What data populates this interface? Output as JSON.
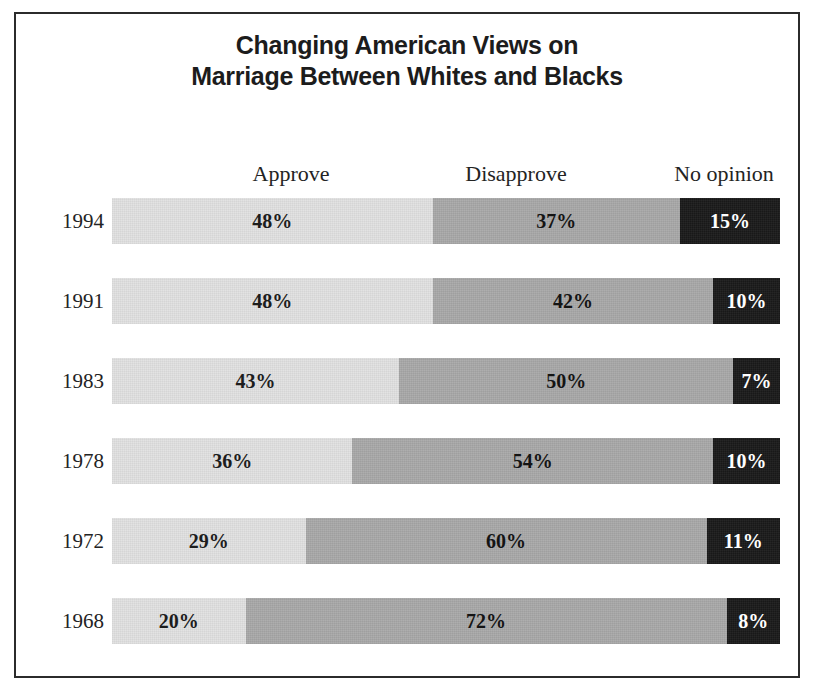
{
  "figure": {
    "title_lines": [
      "Changing American Views on",
      "Marriage Between Whites and Blacks"
    ],
    "border_color": "#2b2b2b",
    "background": "#ffffff"
  },
  "legend_headers": {
    "approve": "Approve",
    "disapprove": "Disapprove",
    "no_opinion": "No opinion"
  },
  "colors": {
    "approve": "#e2e2e2",
    "disapprove": "#a9a9a9",
    "no_opinion": "#1a1a1a",
    "text_dark": "#1d1d1d",
    "text_light": "#ffffff"
  },
  "rows": [
    {
      "year": "1994",
      "approve_label": "48%",
      "disapprove_label": "37%",
      "no_opinion_label": "15%",
      "approve": 48,
      "disapprove": 37,
      "no_opinion": 15
    },
    {
      "year": "1991",
      "approve_label": "48%",
      "disapprove_label": "42%",
      "no_opinion_label": "10%",
      "approve": 48,
      "disapprove": 42,
      "no_opinion": 10
    },
    {
      "year": "1983",
      "approve_label": "43%",
      "disapprove_label": "50%",
      "no_opinion_label": "7%",
      "approve": 43,
      "disapprove": 50,
      "no_opinion": 7
    },
    {
      "year": "1978",
      "approve_label": "36%",
      "disapprove_label": "54%",
      "no_opinion_label": "10%",
      "approve": 36,
      "disapprove": 54,
      "no_opinion": 10
    },
    {
      "year": "1972",
      "approve_label": "29%",
      "disapprove_label": "60%",
      "no_opinion_label": "11%",
      "approve": 29,
      "disapprove": 60,
      "no_opinion": 11
    },
    {
      "year": "1968",
      "approve_label": "20%",
      "disapprove_label": "72%",
      "no_opinion_label": "8%",
      "approve": 20,
      "disapprove": 72,
      "no_opinion": 8
    }
  ],
  "chart_data": {
    "type": "bar",
    "orientation": "horizontal",
    "stacked": true,
    "stack_total": 100,
    "title": "Changing American Views on Marriage Between Whites and Blacks",
    "subtitle": "",
    "xlabel": "",
    "ylabel": "",
    "xlim": [
      0,
      100
    ],
    "grid": false,
    "legend_position": "top",
    "value_format": "percent",
    "categories": [
      "1994",
      "1991",
      "1983",
      "1978",
      "1972",
      "1968"
    ],
    "series": [
      {
        "name": "Approve",
        "color": "#e2e2e2",
        "values": [
          48,
          48,
          43,
          36,
          29,
          20
        ]
      },
      {
        "name": "Disapprove",
        "color": "#a9a9a9",
        "values": [
          37,
          42,
          50,
          54,
          60,
          72
        ]
      },
      {
        "name": "No opinion",
        "color": "#1a1a1a",
        "values": [
          15,
          10,
          7,
          10,
          11,
          8
        ]
      }
    ],
    "data_labels": [
      [
        "48%",
        "37%",
        "15%"
      ],
      [
        "48%",
        "42%",
        "10%"
      ],
      [
        "43%",
        "50%",
        "7%"
      ],
      [
        "36%",
        "54%",
        "10%"
      ],
      [
        "29%",
        "60%",
        "11%"
      ],
      [
        "20%",
        "72%",
        "8%"
      ]
    ]
  }
}
